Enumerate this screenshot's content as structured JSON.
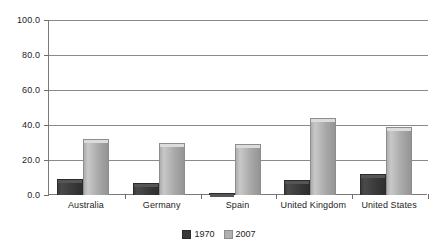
{
  "chart_data": {
    "type": "bar",
    "title": "",
    "xlabel": "",
    "ylabel": "",
    "categories": [
      "Australia",
      "Germany",
      "Spain",
      "United Kingdom",
      "United States"
    ],
    "series": [
      {
        "name": "1970",
        "color": "#3a3a3a",
        "values": [
          9.0,
          7.0,
          1.0,
          8.5,
          12.0
        ]
      },
      {
        "name": "2007",
        "color": "#b0b0b0",
        "values": [
          32.0,
          30.0,
          29.0,
          44.0,
          39.0
        ]
      }
    ],
    "ylim": [
      0.0,
      100.0
    ],
    "yticks": [
      "0.0",
      "20.0",
      "40.0",
      "60.0",
      "80.0",
      "100.0"
    ],
    "ytick_values": [
      0,
      20,
      40,
      60,
      80,
      100
    ],
    "grid": true,
    "legend_position": "bottom"
  },
  "legend": {
    "entries": [
      {
        "label": "1970",
        "marker": "legend-swatch-1970"
      },
      {
        "label": "2007",
        "marker": "legend-swatch-2007"
      }
    ]
  }
}
